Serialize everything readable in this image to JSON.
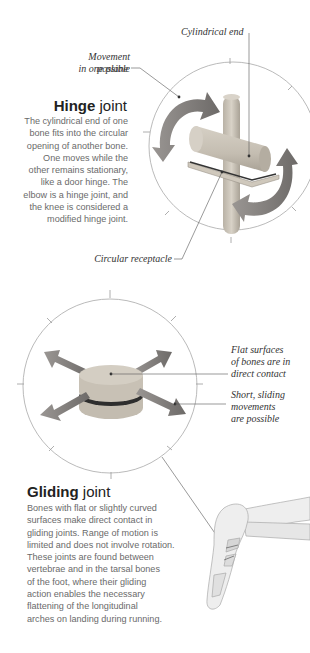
{
  "hinge": {
    "title_bold": "Hinge",
    "title_rest": " joint",
    "description_lines": [
      "The cylindrical end of one",
      "bone fits into the circular",
      "opening of another bone.",
      "One moves while the",
      "other remains stationary,",
      "like a door hinge. The",
      "elbow is a hinge joint, and",
      "the knee is considered a",
      "modified hinge joint."
    ],
    "labels": {
      "cylindrical_end": "Cylindrical end",
      "movement_line1": "Movement possible",
      "movement_line2": "in one plane",
      "circular_receptacle": "Circular receptacle"
    }
  },
  "gliding": {
    "title_bold": "Gliding",
    "title_rest": " joint",
    "description_lines": [
      "Bones with flat or slightly curved",
      "surfaces make direct contact in",
      "gliding joints. Range of motion is",
      "limited and does not involve rotation.",
      "These joints are found between",
      "vertebrae and in the tarsal bones",
      "of the foot, where their gliding",
      "action enables the necessary",
      "flattening of the longitudinal",
      "arches on landing during running."
    ],
    "labels": {
      "flat_line1": "Flat surfaces",
      "flat_line2": "of bones are in",
      "flat_line3": "direct contact",
      "short_line1": "Short, sliding",
      "short_line2": "movements",
      "short_line3": "are possible"
    }
  },
  "colors": {
    "bone": "#c9c3b8",
    "arrow": "#7d7a78",
    "circle": "#9a9a9a",
    "text": "#6a6a6a"
  }
}
